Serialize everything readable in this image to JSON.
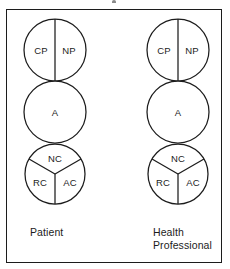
{
  "figure": {
    "type": "transactional-analysis-ego-state-diagram",
    "background_color": "#ffffff",
    "line_color": "#1c1c1c",
    "frame": {
      "border_color": "#1c1c1c"
    }
  },
  "columns": [
    {
      "id": "patient",
      "caption": "Patient",
      "circles": [
        {
          "id": "parent",
          "name": "Parent",
          "division": "vertical-half",
          "segments": [
            {
              "label": "CP",
              "name": "critical-parent"
            },
            {
              "label": "NP",
              "name": "nurturing-parent"
            }
          ]
        },
        {
          "id": "adult",
          "name": "Adult",
          "division": "none",
          "segments": [
            {
              "label": "A",
              "name": "adult"
            }
          ]
        },
        {
          "id": "child",
          "name": "Child",
          "division": "three-way-y",
          "segments": [
            {
              "label": "NC",
              "name": "natural-child"
            },
            {
              "label": "RC",
              "name": "rebellious-child"
            },
            {
              "label": "AC",
              "name": "adapted-child"
            }
          ]
        }
      ]
    },
    {
      "id": "health-professional",
      "caption": "Health\nProfessional",
      "circles": [
        {
          "id": "parent",
          "name": "Parent",
          "division": "vertical-half",
          "segments": [
            {
              "label": "CP",
              "name": "critical-parent"
            },
            {
              "label": "NP",
              "name": "nurturing-parent"
            }
          ]
        },
        {
          "id": "adult",
          "name": "Adult",
          "division": "none",
          "segments": [
            {
              "label": "A",
              "name": "adult"
            }
          ]
        },
        {
          "id": "child",
          "name": "Child",
          "division": "three-way-y",
          "segments": [
            {
              "label": "NC",
              "name": "natural-child"
            },
            {
              "label": "RC",
              "name": "rebellious-child"
            },
            {
              "label": "AC",
              "name": "adapted-child"
            }
          ]
        }
      ]
    }
  ]
}
